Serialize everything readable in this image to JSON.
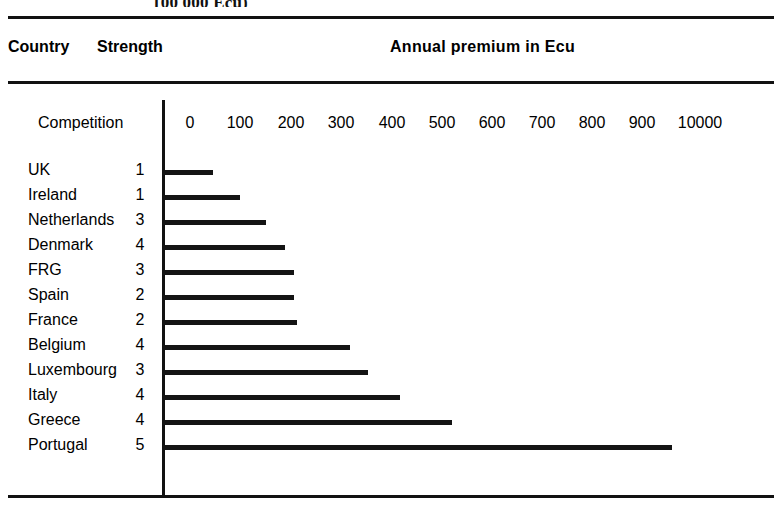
{
  "caption_fragment": "100 000 Ecu)",
  "header": {
    "country_label": "Country",
    "strength_label": "Strength",
    "premium_label": "Annual premium in Ecu"
  },
  "axis": {
    "competition_label": "Competition",
    "tick_labels": [
      "0",
      "100",
      "200",
      "300",
      "400",
      "500",
      "600",
      "700",
      "800",
      "900",
      "10000"
    ],
    "tick_positions_px": [
      190,
      240,
      291,
      341,
      392,
      442,
      492,
      542,
      592,
      642,
      700
    ]
  },
  "colors": {
    "ink": "#111111",
    "bar": "#141414",
    "background": "#ffffff"
  },
  "rows": [
    {
      "country": "UK",
      "strength": "1",
      "value": 50,
      "bar_px": 50
    },
    {
      "country": "Ireland",
      "strength": "1",
      "value": 100,
      "bar_px": 77
    },
    {
      "country": "Netherlands",
      "strength": "3",
      "value": 150,
      "bar_px": 103
    },
    {
      "country": "Denmark",
      "strength": "4",
      "value": 190,
      "bar_px": 122
    },
    {
      "country": "FRG",
      "strength": "3",
      "value": 210,
      "bar_px": 131
    },
    {
      "country": "Spain",
      "strength": "2",
      "value": 210,
      "bar_px": 131
    },
    {
      "country": "France",
      "strength": "2",
      "value": 215,
      "bar_px": 134
    },
    {
      "country": "Belgium",
      "strength": "4",
      "value": 320,
      "bar_px": 187
    },
    {
      "country": "Luxembourg",
      "strength": "3",
      "value": 355,
      "bar_px": 205
    },
    {
      "country": "Italy",
      "strength": "4",
      "value": 420,
      "bar_px": 237
    },
    {
      "country": "Greece",
      "strength": "4",
      "value": 525,
      "bar_px": 289
    },
    {
      "country": "Portugal",
      "strength": "5",
      "value": 965,
      "bar_px": 509
    }
  ],
  "chart_data": {
    "type": "bar",
    "orientation": "horizontal",
    "title": "Annual premium in Ecu",
    "subtitle": "100 000 Ecu)",
    "xlabel": "Annual premium in Ecu",
    "ylabel": "Country",
    "categories": [
      "UK",
      "Ireland",
      "Netherlands",
      "Denmark",
      "FRG",
      "Spain",
      "France",
      "Belgium",
      "Luxembourg",
      "Italy",
      "Greece",
      "Portugal"
    ],
    "values": [
      50,
      100,
      150,
      190,
      210,
      210,
      215,
      320,
      355,
      420,
      525,
      965
    ],
    "series": [
      {
        "name": "Annual premium in Ecu",
        "values": [
          50,
          100,
          150,
          190,
          210,
          210,
          215,
          320,
          355,
          420,
          525,
          965
        ]
      },
      {
        "name": "Competition strength",
        "values": [
          1,
          1,
          3,
          4,
          3,
          2,
          2,
          4,
          3,
          4,
          4,
          5
        ]
      }
    ],
    "xlim": [
      0,
      1000
    ],
    "xticks": [
      0,
      100,
      200,
      300,
      400,
      500,
      600,
      700,
      800,
      900,
      1000
    ],
    "xticklabels": [
      "0",
      "100",
      "200",
      "300",
      "400",
      "500",
      "600",
      "700",
      "800",
      "900",
      "10000"
    ],
    "grid": false,
    "legend": "none",
    "extra_columns": [
      {
        "header": "Country",
        "values": [
          "UK",
          "Ireland",
          "Netherlands",
          "Denmark",
          "FRG",
          "Spain",
          "France",
          "Belgium",
          "Luxembourg",
          "Italy",
          "Greece",
          "Portugal"
        ]
      },
      {
        "header": "Strength",
        "values": [
          "1",
          "1",
          "3",
          "4",
          "3",
          "2",
          "2",
          "4",
          "3",
          "4",
          "4",
          "5"
        ]
      }
    ],
    "annotations": [
      "Competition"
    ]
  }
}
